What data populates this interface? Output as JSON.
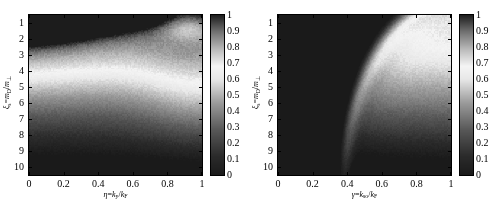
{
  "figure": {
    "background": "#ffffff",
    "panel_count": 2
  },
  "chart_data": [
    {
      "id": "left",
      "type": "heatmap",
      "title": "",
      "xlabel": "η=k_y/k_F",
      "xlabel_parts": {
        "var": "η",
        "eq": "=",
        "num": "k",
        "num_sub": "y",
        "slash": "/",
        "den": "k",
        "den_sub": "F"
      },
      "ylabel": "ξ_s=m_D/m_⊥",
      "ylabel_parts": {
        "var": "ξ",
        "var_sub": "s",
        "eq": "=",
        "num": "m",
        "num_sub": "D",
        "slash": "/",
        "den": "m",
        "den_sub": "⊥"
      },
      "xlim": [
        0,
        1
      ],
      "ylim": [
        0.5,
        10.5
      ],
      "xticks": [
        0,
        0.2,
        0.4,
        0.6,
        0.8,
        1
      ],
      "xticklabels": [
        "0",
        "0.2",
        "0.4",
        "0.6",
        "0.8",
        "1"
      ],
      "yticks": [
        1,
        2,
        3,
        4,
        5,
        6,
        7,
        8,
        9,
        10
      ],
      "yticklabels": [
        "1",
        "2",
        "3",
        "4",
        "5",
        "6",
        "7",
        "8",
        "9",
        "10"
      ],
      "grid": false,
      "colormap": "gray-bright-mid",
      "clim": [
        0,
        1
      ],
      "noise_amplitude": 0.018,
      "field": "left-surface",
      "description": "Bright diagonal ridge along the top edge rising from left to a peak near eta=0.78, dark lobe near top-right corner, smooth fall-off to very dark values at bottom."
    },
    {
      "id": "right",
      "type": "heatmap",
      "title": "",
      "xlabel": "γ=k_so/k_F",
      "xlabel_parts": {
        "var": "γ",
        "eq": "=",
        "num": "k",
        "num_sub": "so",
        "slash": "/",
        "den": "k",
        "den_sub": "F"
      },
      "ylabel": "ξ_s=m_D/m_⊥",
      "ylabel_parts": {
        "var": "ξ",
        "var_sub": "s",
        "eq": "=",
        "num": "m",
        "num_sub": "D",
        "slash": "/",
        "den": "m",
        "den_sub": "⊥"
      },
      "xlim": [
        0,
        1
      ],
      "ylim": [
        0.5,
        10.5
      ],
      "xticks": [
        0,
        0.2,
        0.4,
        0.6,
        0.8,
        1
      ],
      "xticklabels": [
        "0",
        "0.2",
        "0.4",
        "0.6",
        "0.8",
        "1"
      ],
      "yticks": [
        1,
        2,
        3,
        4,
        5,
        6,
        7,
        8,
        9,
        10
      ],
      "yticklabels": [
        "1",
        "2",
        "3",
        "4",
        "5",
        "6",
        "7",
        "8",
        "9",
        "10"
      ],
      "grid": false,
      "colormap": "gray-bright-mid",
      "clim": [
        0,
        1
      ],
      "noise_amplitude": 0.018,
      "field": "right-arc",
      "description": "Bright arc sweeping from top-centre down to the bottom-right corner separating a light upper-left plateau from a dark wedge at the right edge; large dark region fills the lower-left."
    }
  ],
  "colorbar": {
    "ticks": [
      0,
      0.1,
      0.2,
      0.3,
      0.4,
      0.5,
      0.6,
      0.7,
      0.8,
      0.9,
      1
    ],
    "ticklabels": [
      "0",
      "0.1",
      "0.2",
      "0.3",
      "0.4",
      "0.5",
      "0.6",
      "0.7",
      "0.8",
      "0.9",
      "1"
    ],
    "orientation": "vertical",
    "clim": [
      0,
      1
    ],
    "stops": [
      {
        "value": 0.0,
        "color": "#1a1a1a"
      },
      {
        "value": 0.12,
        "color": "#2b2b2b"
      },
      {
        "value": 0.28,
        "color": "#575757"
      },
      {
        "value": 0.45,
        "color": "#9a9a9a"
      },
      {
        "value": 0.6,
        "color": "#e8e8e8"
      },
      {
        "value": 0.68,
        "color": "#f4f4f4"
      },
      {
        "value": 0.78,
        "color": "#bdbdbd"
      },
      {
        "value": 0.9,
        "color": "#6d6d6d"
      },
      {
        "value": 1.0,
        "color": "#1c1c1c"
      }
    ]
  }
}
